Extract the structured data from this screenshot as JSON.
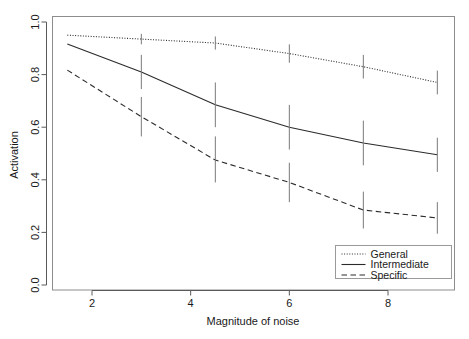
{
  "chart_data": {
    "type": "line",
    "title": "",
    "xlabel": "Magnitude of noise",
    "ylabel": "Activation",
    "x": [
      1.5,
      3.0,
      4.5,
      6.0,
      7.5,
      9.0
    ],
    "xlim": [
      1.0,
      9.6
    ],
    "ylim": [
      0.0,
      1.04
    ],
    "xticks": [
      2,
      4,
      6,
      8
    ],
    "xtick_labels": [
      "2",
      "4",
      "6",
      "8"
    ],
    "yticks": [
      0.0,
      0.2,
      0.4,
      0.6,
      0.8,
      1.0
    ],
    "ytick_labels": [
      "0.0",
      "0.2",
      "0.4",
      "0.6",
      "0.8",
      "1.0"
    ],
    "grid": false,
    "legend_position": "bottom-right",
    "series": [
      {
        "name": "General",
        "style": "dotted",
        "color": "#2b2b2b",
        "values": [
          0.95,
          0.935,
          0.92,
          0.88,
          0.83,
          0.77
        ],
        "err_low": [
          0.95,
          0.915,
          0.895,
          0.845,
          0.785,
          0.725
        ],
        "err_high": [
          0.95,
          0.955,
          0.945,
          0.915,
          0.875,
          0.815
        ]
      },
      {
        "name": "Intermediate",
        "style": "solid",
        "color": "#2b2b2b",
        "values": [
          0.916,
          0.81,
          0.685,
          0.6,
          0.54,
          0.495
        ],
        "err_low": [
          0.916,
          0.745,
          0.6,
          0.515,
          0.455,
          0.43
        ],
        "err_high": [
          0.916,
          0.875,
          0.77,
          0.685,
          0.625,
          0.56
        ]
      },
      {
        "name": "Specific",
        "style": "dashed",
        "color": "#2b2b2b",
        "values": [
          0.817,
          0.64,
          0.475,
          0.39,
          0.285,
          0.255
        ],
        "err_low": [
          0.817,
          0.565,
          0.39,
          0.315,
          0.215,
          0.195
        ],
        "err_high": [
          0.817,
          0.715,
          0.565,
          0.465,
          0.355,
          0.315
        ]
      }
    ]
  },
  "axes": {
    "y_title": "Activation",
    "x_title": "Magnitude of noise"
  },
  "legend": {
    "entries": [
      {
        "label": "General",
        "style": "dotted"
      },
      {
        "label": "Intermediate",
        "style": "solid"
      },
      {
        "label": "Specific",
        "style": "dashed"
      }
    ]
  }
}
